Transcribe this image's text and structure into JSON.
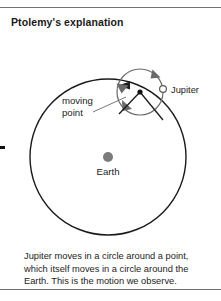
{
  "title": "Ptolemy's explanation",
  "caption": {
    "lines": [
      "Jupiter moves in a circle around a point,",
      "which itself moves in a circle around the",
      "Earth. This is the motion we observe."
    ]
  },
  "diagram": {
    "labels": {
      "jupiter": "Jupiter",
      "moving_point_line1": "moving",
      "moving_point_line2": "point",
      "earth": "Earth"
    },
    "icons": {
      "jupiter_marker": "open-circle-marker",
      "earth_marker": "filled-circle-marker",
      "moving_point_marker": "small-dot-marker",
      "deferent_arrow": "counterclockwise-arrowhead",
      "epicycle_arrow_top": "clockwise-arrowhead",
      "epicycle_arrow_left": "clockwise-arrowhead",
      "epicycle_arrow_bottom": "clockwise-arrowhead"
    },
    "colors": {
      "stroke_deferent": "#1a1a1a",
      "stroke_epicycle": "#6a6a6a",
      "earth_fill": "#7b7b7b",
      "rule": "#6f7378",
      "text": "#1c1c1c"
    },
    "geometry": {
      "deferent_center": [
        108,
        157
      ],
      "deferent_radius": 78,
      "epicycle_center": [
        140,
        92
      ],
      "epicycle_radius": 23,
      "jupiter_position": [
        163,
        89
      ],
      "earth_position": [
        108,
        157
      ]
    }
  }
}
